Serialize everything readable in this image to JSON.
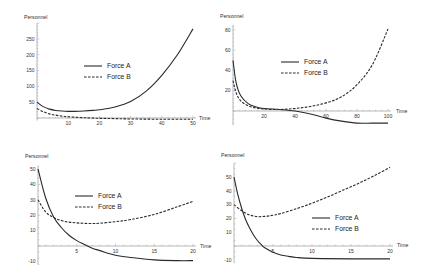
{
  "chart_data": [
    {
      "id": "top-left",
      "type": "line",
      "title": "",
      "xlabel": "Time",
      "ylabel": "Personnel",
      "xlim": [
        0,
        50
      ],
      "ylim": [
        -8,
        300
      ],
      "xticks": [
        10,
        20,
        30,
        40,
        50
      ],
      "yticks": [
        50,
        100,
        150,
        200,
        250
      ],
      "grid": false,
      "legend": {
        "entries": [
          "Force A",
          "Force B"
        ],
        "position": "center"
      },
      "series": [
        {
          "name": "Force A",
          "style": "solid",
          "x": [
            0,
            2,
            4,
            6,
            8,
            10,
            12,
            15,
            18,
            20,
            25,
            30,
            35,
            40,
            45,
            50
          ],
          "values": [
            50,
            36,
            28,
            24,
            22,
            21,
            21,
            22,
            24,
            26,
            35,
            52,
            85,
            135,
            200,
            282
          ]
        },
        {
          "name": "Force B",
          "style": "dashed",
          "x": [
            0,
            2,
            4,
            6,
            8,
            10,
            15,
            20,
            25,
            30,
            40,
            50
          ],
          "values": [
            30,
            20,
            13,
            9,
            6,
            4,
            1,
            -1,
            -2,
            -3,
            -4,
            -4
          ]
        }
      ]
    },
    {
      "id": "top-right",
      "type": "line",
      "title": "",
      "xlabel": "Time",
      "ylabel": "Personnel",
      "xlim": [
        0,
        100
      ],
      "ylim": [
        -14,
        85
      ],
      "xticks": [
        20,
        40,
        60,
        80,
        100
      ],
      "yticks": [
        20,
        40,
        60,
        80
      ],
      "grid": false,
      "legend": {
        "entries": [
          "Force A",
          "Force B"
        ],
        "position": "center"
      },
      "series": [
        {
          "name": "Force A",
          "style": "solid",
          "x": [
            0,
            2,
            5,
            10,
            15,
            20,
            30,
            40,
            50,
            60,
            70,
            80,
            90,
            100
          ],
          "values": [
            50,
            28,
            15,
            7,
            4,
            2.5,
            1.5,
            0,
            -3,
            -7,
            -10,
            -12,
            -12,
            -12
          ]
        },
        {
          "name": "Force B",
          "style": "dashed",
          "x": [
            0,
            2,
            5,
            10,
            15,
            20,
            30,
            40,
            50,
            60,
            70,
            80,
            90,
            100
          ],
          "values": [
            30,
            18,
            10,
            5,
            3,
            2,
            1.5,
            2.5,
            4.5,
            8,
            14,
            26,
            46,
            81
          ]
        }
      ]
    },
    {
      "id": "bottom-left",
      "type": "line",
      "title": "",
      "xlabel": "Time",
      "ylabel": "Personnel",
      "xlim": [
        0,
        20
      ],
      "ylim": [
        -12,
        52
      ],
      "xticks": [
        5,
        10,
        15,
        20
      ],
      "yticks": [
        -10,
        10,
        20,
        30,
        40,
        50
      ],
      "grid": false,
      "legend": {
        "entries": [
          "Force A",
          "Force B"
        ],
        "position": "center"
      },
      "series": [
        {
          "name": "Force A",
          "style": "solid",
          "x": [
            0,
            1,
            2,
            3,
            4,
            5,
            6,
            7,
            8,
            10,
            12,
            15,
            18,
            20
          ],
          "values": [
            50,
            31,
            19,
            12,
            7,
            3.5,
            1,
            -1.5,
            -3,
            -6,
            -7.5,
            -9,
            -9.5,
            -9.5
          ]
        },
        {
          "name": "Force B",
          "style": "dashed",
          "x": [
            0,
            1,
            2,
            3,
            4,
            5,
            6,
            7,
            8,
            10,
            12,
            15,
            18,
            20
          ],
          "values": [
            30,
            22,
            18.5,
            16.5,
            15.5,
            15,
            14.7,
            14.6,
            14.8,
            15.8,
            17.2,
            20.5,
            25.5,
            29
          ]
        }
      ]
    },
    {
      "id": "bottom-right",
      "type": "line",
      "title": "",
      "xlabel": "Time",
      "ylabel": "Personnel",
      "xlim": [
        0,
        20
      ],
      "ylim": [
        -12,
        60
      ],
      "xticks": [
        5,
        10,
        15,
        20
      ],
      "yticks": [
        -10,
        10,
        20,
        30,
        40,
        50
      ],
      "grid": false,
      "legend": {
        "entries": [
          "Force A",
          "Force B"
        ],
        "position": "center-right"
      },
      "series": [
        {
          "name": "Force A",
          "style": "solid",
          "x": [
            0,
            0.5,
            1,
            1.5,
            2,
            2.5,
            3,
            3.5,
            4,
            5,
            6,
            7,
            8,
            10,
            15,
            20
          ],
          "values": [
            50,
            37,
            27,
            19,
            13,
            8,
            4,
            1,
            -1.5,
            -4.5,
            -6.5,
            -7.5,
            -8.3,
            -9,
            -9.3,
            -9.3
          ]
        },
        {
          "name": "Force B",
          "style": "dashed",
          "x": [
            0,
            1,
            2,
            3,
            4,
            5,
            6,
            8,
            10,
            12,
            14,
            16,
            18,
            20
          ],
          "values": [
            30,
            25.5,
            22.5,
            21.3,
            21.5,
            22.3,
            23.5,
            27,
            31,
            35.5,
            40.5,
            45.5,
            51,
            57
          ]
        }
      ]
    }
  ],
  "layout": {
    "panels": [
      {
        "x0px": 37,
        "x1px": 193,
        "y0px": 118,
        "yTopPx": 39,
        "yTopVal": 250,
        "xEndVal": 50,
        "ylabelPos": [
          24,
          19
        ],
        "xlabelPos": [
          199,
          120
        ],
        "legendPos": [
          84,
          66
        ]
      },
      {
        "x0px": 233,
        "x1px": 388,
        "y0px": 111,
        "yTopPx": 30,
        "yTopVal": 80,
        "xEndVal": 100,
        "ylabelPos": [
          220,
          18
        ],
        "xlabelPos": [
          396,
          113
        ],
        "legendPos": [
          281,
          62
        ]
      },
      {
        "x0px": 38,
        "x1px": 193,
        "y0px": 246,
        "yTopPx": 169,
        "yTopVal": 50,
        "xEndVal": 20,
        "ylabelPos": [
          25,
          158
        ],
        "xlabelPos": [
          200,
          248
        ],
        "legendPos": [
          75,
          196
        ]
      },
      {
        "x0px": 234,
        "x1px": 390,
        "y0px": 246,
        "yTopPx": 177,
        "yTopVal": 50,
        "xEndVal": 20,
        "ylabelPos": [
          221,
          157
        ],
        "xlabelPos": [
          397,
          247
        ],
        "legendPos": [
          312,
          218
        ]
      }
    ],
    "colors": {
      "line": "#2a2a2a",
      "axis": "#9a9a9a",
      "text": "#333333"
    }
  }
}
